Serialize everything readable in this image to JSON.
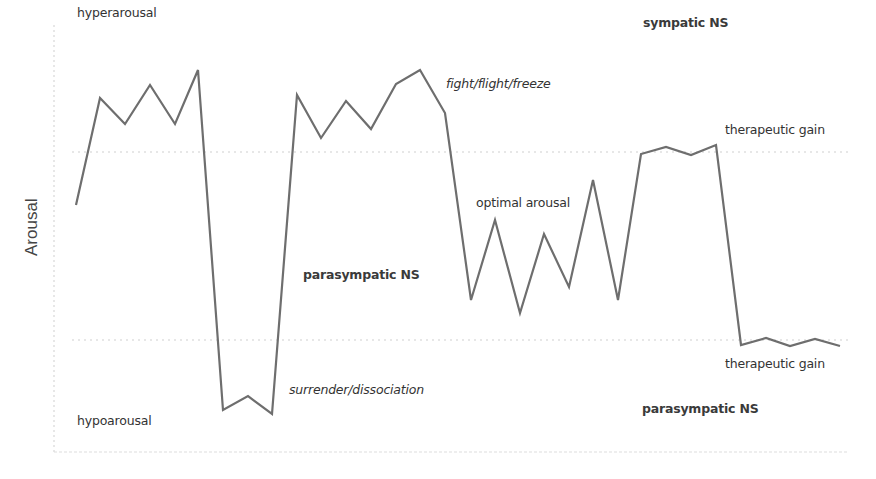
{
  "chart_data": {
    "type": "line",
    "title": "",
    "xlabel": "",
    "ylabel": "Arousal",
    "grid": "two dotted horizontal reference lines (upper and lower window boundaries)",
    "legend": "none",
    "series": [
      {
        "name": "arousal trajectory",
        "color": "#6e6e6e",
        "points": [
          [
            76,
            205
          ],
          [
            100,
            98
          ],
          [
            125,
            124
          ],
          [
            150,
            85
          ],
          [
            175,
            124
          ],
          [
            198,
            70
          ],
          [
            223,
            410
          ],
          [
            248,
            396
          ],
          [
            272,
            414
          ],
          [
            297,
            95
          ],
          [
            321,
            138
          ],
          [
            346,
            101
          ],
          [
            371,
            129
          ],
          [
            396,
            84
          ],
          [
            420,
            70
          ],
          [
            445,
            113
          ],
          [
            471,
            300
          ],
          [
            495,
            220
          ],
          [
            520,
            313
          ],
          [
            544,
            234
          ],
          [
            569,
            287
          ],
          [
            593,
            180
          ],
          [
            618,
            300
          ],
          [
            641,
            154
          ],
          [
            666,
            147
          ],
          [
            691,
            155
          ],
          [
            716,
            145
          ],
          [
            741,
            345
          ],
          [
            766,
            338
          ],
          [
            790,
            346
          ],
          [
            815,
            339
          ],
          [
            840,
            346
          ]
        ]
      }
    ],
    "reference_lines": [
      {
        "name": "upper-window-boundary",
        "y": 152
      },
      {
        "name": "lower-window-boundary",
        "y": 340
      }
    ],
    "annotations": [
      {
        "id": "hyperarousal",
        "text": "hyperarousal",
        "style": "normal",
        "x": 76,
        "y": 6
      },
      {
        "id": "sympatic-ns",
        "text": "sympatic NS",
        "style": "bold",
        "x": 643,
        "y": 16
      },
      {
        "id": "fight-flight-freeze",
        "text": "fight/flight/freeze",
        "style": "italic",
        "x": 446,
        "y": 77
      },
      {
        "id": "therapeutic-gain-upper",
        "text": "therapeutic gain",
        "style": "normal",
        "x": 725,
        "y": 123
      },
      {
        "id": "optimal-arousal",
        "text": "optimal arousal",
        "style": "normal",
        "x": 476,
        "y": 196
      },
      {
        "id": "parasympatic-ns-mid",
        "text": "parasympatic NS",
        "style": "bold",
        "x": 303,
        "y": 268
      },
      {
        "id": "therapeutic-gain-lower",
        "text": "therapeutic gain",
        "style": "normal",
        "x": 725,
        "y": 357
      },
      {
        "id": "surrender-dissociation",
        "text": "surrender/dissociation",
        "style": "italic",
        "x": 289,
        "y": 383
      },
      {
        "id": "parasympatic-ns-bottom",
        "text": "parasympatic NS",
        "style": "bold",
        "x": 642,
        "y": 402
      },
      {
        "id": "hypoarousal",
        "text": "hypoarousal",
        "style": "normal",
        "x": 76,
        "y": 414
      }
    ]
  },
  "labels": {
    "ylabel": "Arousal",
    "hyperarousal": "hyperarousal",
    "sympatic_ns": "sympatic NS",
    "fight": "fight/flight/freeze",
    "therapeutic_gain_upper": "therapeutic gain",
    "optimal": "optimal arousal",
    "parasympatic_mid": "parasympatic NS",
    "therapeutic_gain_lower": "therapeutic gain",
    "surrender": "surrender/dissociation",
    "parasympatic_bottom": "parasympatic NS",
    "hypoarousal": "hypoarousal"
  },
  "colors": {
    "line": "#6e6e6e",
    "axis": "#d8d8d8",
    "reference": "#cfcfcf",
    "text": "#333333"
  }
}
